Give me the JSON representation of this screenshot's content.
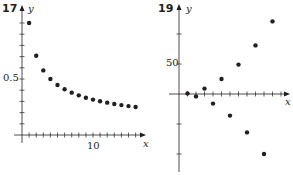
{
  "colors": {
    "ink": "#231f20",
    "background": "#ffffff"
  },
  "chart_data": [
    {
      "type": "scatter",
      "title": "17",
      "xlabel": "x",
      "ylabel": "y",
      "x": [
        1,
        2,
        3,
        4,
        5,
        6,
        7,
        8,
        9,
        10,
        11,
        12,
        13,
        14,
        15,
        16
      ],
      "values": [
        1.0,
        0.707,
        0.577,
        0.5,
        0.447,
        0.408,
        0.378,
        0.354,
        0.333,
        0.316,
        0.302,
        0.289,
        0.277,
        0.267,
        0.258,
        0.25
      ],
      "x_tick_labels": [
        {
          "value": 10,
          "label": "10"
        }
      ],
      "y_tick_labels": [
        {
          "value": 0.5,
          "label": "0.5"
        }
      ],
      "xlim": [
        0,
        17
      ],
      "ylim": [
        0,
        1.05
      ],
      "x_tick_step": 1,
      "y_tick_step": 0.1,
      "grid": false
    },
    {
      "type": "scatter",
      "title": "19",
      "xlabel": "x",
      "ylabel": "y",
      "x": [
        1,
        2,
        3,
        4,
        5,
        6,
        7,
        8,
        9,
        10,
        11
      ],
      "values": [
        1,
        -4,
        9,
        -16,
        25,
        -36,
        49,
        -64,
        81,
        -100,
        121
      ],
      "x_tick_labels": [],
      "y_tick_labels": [
        {
          "value": 50,
          "label": "50"
        }
      ],
      "xlim": [
        0,
        12
      ],
      "ylim": [
        -125,
        135
      ],
      "x_tick_step": 1,
      "y_tick_step": 50,
      "grid": false
    }
  ],
  "panels": {
    "left": {
      "number": "17",
      "x_axis_label": "x",
      "y_axis_label": "y",
      "x_tick": "10",
      "y_tick": "0.5"
    },
    "right": {
      "number": "19",
      "x_axis_label": "x",
      "y_axis_label": "y",
      "y_tick": "50"
    }
  }
}
